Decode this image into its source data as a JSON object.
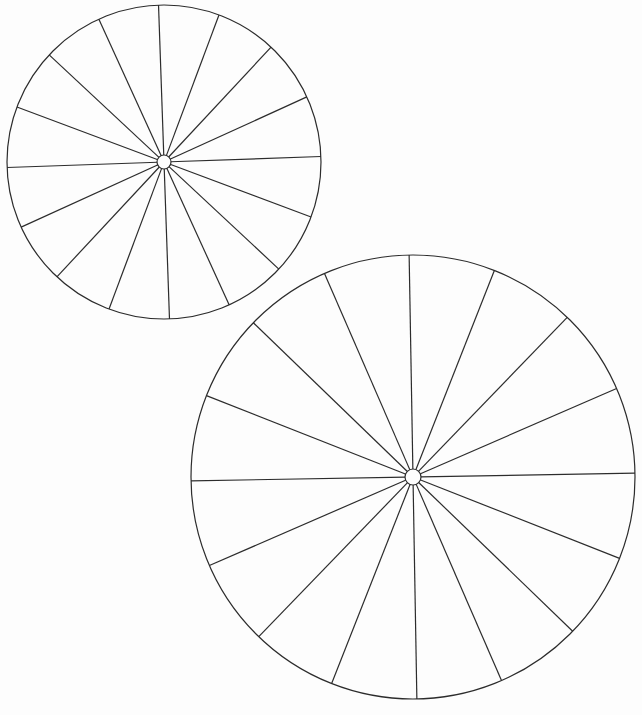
{
  "page": {
    "width": 642,
    "height": 715,
    "background_color": "#fdfdfd",
    "stroke_color": "#2c2c2c",
    "hub_fill_color": "#fdfdfd"
  },
  "chart_data": {
    "type": "diagram",
    "title": "",
    "subtitle": "",
    "xlabel": "",
    "ylabel": "",
    "grid": false,
    "legend": false,
    "annotations": [],
    "shapes": [
      {
        "name": "wheel-small",
        "label": "Upper-left wheel",
        "kind": "spoked-circle",
        "center_x": 164,
        "center_y": 162,
        "radius": 157,
        "hub_radius": 7,
        "spoke_count": 16,
        "sector_count": 16,
        "sector_angle_deg": 22.5,
        "rotation_offset_deg": -2,
        "stroke_width": 1.2,
        "spoke_angles_deg": [
          -2,
          20.5,
          43,
          65.5,
          88,
          110.5,
          133,
          155.5,
          178,
          200.5,
          223,
          245.5,
          268,
          290.5,
          313,
          335.5
        ]
      },
      {
        "name": "wheel-large",
        "label": "Lower-right wheel",
        "kind": "spoked-circle",
        "center_x": 413,
        "center_y": 477,
        "radius": 222,
        "hub_radius": 8,
        "spoke_count": 16,
        "sector_count": 16,
        "sector_angle_deg": 22.5,
        "rotation_offset_deg": -1,
        "stroke_width": 1.2,
        "spoke_angles_deg": [
          -1,
          21.5,
          44,
          66.5,
          89,
          111.5,
          134,
          156.5,
          179,
          201.5,
          224,
          246.5,
          269,
          291.5,
          314,
          336.5
        ]
      }
    ]
  }
}
